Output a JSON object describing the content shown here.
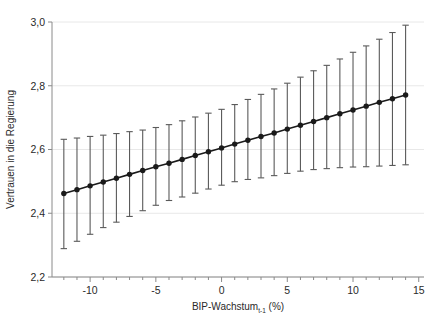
{
  "chart_data": {
    "type": "line",
    "title": "",
    "subtitle": "",
    "xlabel": "BIP-Wachstum",
    "xlabel_sub": "t-1",
    "xlabel_unit": "(%)",
    "ylabel": "Vertrauen in die Regierung",
    "xlim": [
      -12.9,
      15.4
    ],
    "ylim": [
      2.2,
      3.0
    ],
    "xticks": [
      -10,
      -5,
      0,
      5,
      10,
      15
    ],
    "xtick_labels": [
      "-10",
      "-5",
      "0",
      "5",
      "10",
      "15"
    ],
    "yticks": [
      2.2,
      2.4,
      2.6,
      2.8,
      3.0
    ],
    "ytick_labels": [
      "2,2",
      "2,4",
      "2,6",
      "2,8",
      "3,0"
    ],
    "minor_xtick_step": 1,
    "grid": "horizontal",
    "legend": "none",
    "marker": "filled-circle",
    "errorbar_style": "capped-vertical",
    "line_color": "#1a1a1a",
    "errorbar_color": "#5a5a5a",
    "grid_color": "#e8e8e8",
    "axis_color": "#8a8a8a",
    "x": [
      -12,
      -11,
      -10,
      -9,
      -8,
      -7,
      -6,
      -5,
      -4,
      -3,
      -2,
      -1,
      0,
      1,
      2,
      3,
      4,
      5,
      6,
      7,
      8,
      9,
      10,
      11,
      12,
      13,
      14
    ],
    "series": [
      {
        "name": "Vorhergesagtes Vertrauen",
        "values": [
          2.462,
          2.474,
          2.486,
          2.498,
          2.51,
          2.522,
          2.534,
          2.546,
          2.557,
          2.569,
          2.581,
          2.593,
          2.605,
          2.617,
          2.629,
          2.641,
          2.652,
          2.664,
          2.676,
          2.688,
          2.7,
          2.712,
          2.724,
          2.736,
          2.748,
          2.759,
          2.771
        ],
        "ci_lower": [
          2.289,
          2.312,
          2.334,
          2.355,
          2.372,
          2.39,
          2.408,
          2.425,
          2.44,
          2.451,
          2.463,
          2.476,
          2.488,
          2.499,
          2.506,
          2.511,
          2.518,
          2.525,
          2.532,
          2.537,
          2.54,
          2.543,
          2.545,
          2.546,
          2.548,
          2.55,
          2.552
        ],
        "ci_upper": [
          2.632,
          2.636,
          2.641,
          2.645,
          2.65,
          2.656,
          2.661,
          2.669,
          2.678,
          2.69,
          2.702,
          2.714,
          2.726,
          2.741,
          2.757,
          2.773,
          2.79,
          2.808,
          2.827,
          2.847,
          2.864,
          2.884,
          2.905,
          2.925,
          2.946,
          2.967,
          2.99
        ]
      }
    ]
  }
}
